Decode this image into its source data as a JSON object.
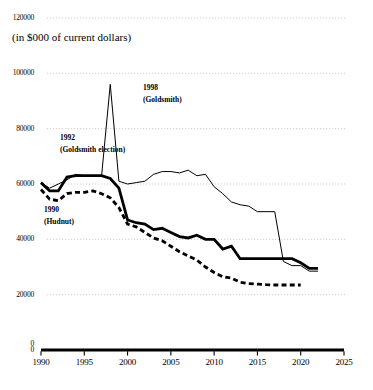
{
  "chart_data": {
    "type": "line",
    "title": "",
    "subtitle": "(in $000 of current dollars)",
    "xlabel": "",
    "ylabel": "",
    "xlim": [
      1990,
      2025
    ],
    "ylim": [
      0,
      120000
    ],
    "xticks": [
      1990,
      1995,
      2000,
      2005,
      2010,
      2015,
      2020,
      2025
    ],
    "yticks": [
      0,
      20000,
      40000,
      60000,
      80000,
      100000,
      120000
    ],
    "grid": true,
    "legend": "none",
    "series": [
      {
        "name": "thin-solid",
        "style": "solid-thin",
        "x": [
          1990,
          1991,
          1992,
          1993,
          1994,
          1995,
          1996,
          1997,
          1998,
          1999,
          2000,
          2001,
          2002,
          2003,
          2004,
          2005,
          2006,
          2007,
          2008,
          2009,
          2010,
          2011,
          2012,
          2013,
          2014,
          2015,
          2016,
          2017,
          2018,
          2019,
          2020,
          2021,
          2022
        ],
        "values": [
          60500,
          58500,
          60000,
          61500,
          63500,
          63000,
          63000,
          63000,
          96000,
          61000,
          60000,
          60500,
          61000,
          63500,
          64500,
          64500,
          64000,
          65000,
          63000,
          63500,
          59000,
          56500,
          53500,
          52500,
          52000,
          50000,
          50000,
          50000,
          32000,
          30500,
          30500,
          28500,
          28500
        ]
      },
      {
        "name": "thick-solid",
        "style": "solid-thick",
        "x": [
          1990,
          1991,
          1992,
          1993,
          1994,
          1995,
          1996,
          1997,
          1998,
          1999,
          2000,
          2001,
          2002,
          2003,
          2004,
          2005,
          2006,
          2007,
          2008,
          2009,
          2010,
          2011,
          2012,
          2013,
          2014,
          2015,
          2016,
          2017,
          2018,
          2019,
          2020,
          2021,
          2022
        ],
        "values": [
          60500,
          57500,
          57500,
          62500,
          63000,
          63000,
          63000,
          63000,
          62000,
          58500,
          47000,
          46000,
          45500,
          43500,
          44000,
          42500,
          41000,
          40500,
          41500,
          40000,
          40000,
          36500,
          37500,
          33000,
          33000,
          33000,
          33000,
          33000,
          33000,
          33000,
          31500,
          29500,
          29500
        ]
      },
      {
        "name": "dashed",
        "style": "dashed-thick",
        "x": [
          1990,
          1991,
          1992,
          1993,
          1994,
          1995,
          1996,
          1997,
          1998,
          1999,
          2000,
          2001,
          2002,
          2003,
          2004,
          2005,
          2006,
          2007,
          2008,
          2009,
          2010,
          2011,
          2012,
          2013,
          2014,
          2015,
          2016,
          2017,
          2018,
          2019,
          2020
        ],
        "values": [
          58000,
          54500,
          54000,
          56500,
          57000,
          57000,
          57500,
          56500,
          55000,
          51500,
          45500,
          44500,
          42500,
          40500,
          39500,
          37500,
          35500,
          34000,
          32500,
          30000,
          28000,
          26500,
          26000,
          24500,
          24000,
          23800,
          23600,
          23500,
          23500,
          23500,
          23500
        ]
      }
    ],
    "annotations": [
      {
        "name": "annotation-1992",
        "line1": "1992",
        "line2": "(Goldsmith election)",
        "x_px": 60,
        "y_px": 132
      },
      {
        "name": "annotation-1998",
        "line1": "1998",
        "line2": "(Goldsmith)",
        "x_px": 143,
        "y_px": 82
      },
      {
        "name": "annotation-1990",
        "line1": "1990",
        "line2": "(Hudnut)",
        "x_px": 44,
        "y_px": 204
      }
    ],
    "colors": {
      "line": "#000000",
      "grid": "#b9b9b9",
      "axis": "#000000",
      "background": "#ffffff"
    }
  }
}
